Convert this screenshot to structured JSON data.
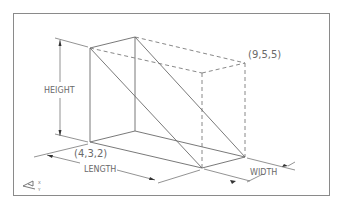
{
  "diagram": {
    "labels": {
      "height": "HEIGHT",
      "length": "LENGTH",
      "width": "WIDTH",
      "near_corner": "(4,3,2)",
      "far_corner": "(9,5,5)"
    },
    "icon": "ucs-axis-icon",
    "colors": {
      "line": "#6a6a6a",
      "background": "#ffffff"
    }
  }
}
